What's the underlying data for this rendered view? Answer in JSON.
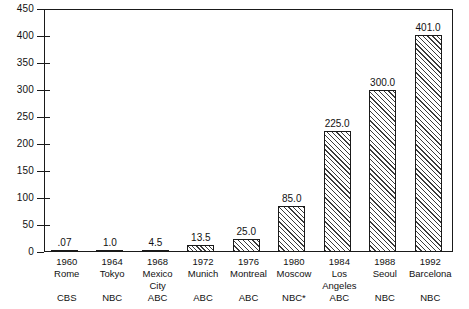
{
  "chart_data": {
    "type": "bar",
    "title": "",
    "subtitle": "",
    "xlabel": "",
    "ylabel": "",
    "ylim": [
      0,
      450
    ],
    "ytick_step": 50,
    "yticks": [
      "450",
      "400",
      "350",
      "300",
      "250",
      "200",
      "150",
      "100",
      "50",
      "0"
    ],
    "grid": false,
    "legend": false,
    "categories": [
      "1960 Rome",
      "1964 Tokyo",
      "1968 Mexico City",
      "1972 Munich",
      "1976 Montreal",
      "1980 Moscow",
      "1984 Los Angeles",
      "1988 Seoul",
      "1992 Barcelona"
    ],
    "values": [
      0.07,
      1.0,
      4.5,
      13.5,
      25.0,
      85.0,
      225.0,
      300.0,
      401.0
    ],
    "data_labels": [
      ".07",
      "1.0",
      "4.5",
      "13.5",
      "25.0",
      "85.0",
      "225.0",
      "300.0",
      "401.0"
    ],
    "bars": [
      {
        "year": "1960",
        "city_line1": "Rome",
        "city_line2": "",
        "network": "CBS",
        "value": 0.07,
        "label": ".07"
      },
      {
        "year": "1964",
        "city_line1": "Tokyo",
        "city_line2": "",
        "network": "NBC",
        "value": 1.0,
        "label": "1.0"
      },
      {
        "year": "1968",
        "city_line1": "Mexico",
        "city_line2": "City",
        "network": "ABC",
        "value": 4.5,
        "label": "4.5"
      },
      {
        "year": "1972",
        "city_line1": "Munich",
        "city_line2": "",
        "network": "ABC",
        "value": 13.5,
        "label": "13.5"
      },
      {
        "year": "1976",
        "city_line1": "Montreal",
        "city_line2": "",
        "network": "ABC",
        "value": 25.0,
        "label": "25.0"
      },
      {
        "year": "1980",
        "city_line1": "Moscow",
        "city_line2": "",
        "network": "NBC*",
        "value": 85.0,
        "label": "85.0"
      },
      {
        "year": "1984",
        "city_line1": "Los",
        "city_line2": "Angeles",
        "network": "ABC",
        "value": 225.0,
        "label": "225.0"
      },
      {
        "year": "1988",
        "city_line1": "Seoul",
        "city_line2": "",
        "network": "NBC",
        "value": 300.0,
        "label": "300.0"
      },
      {
        "year": "1992",
        "city_line1": "Barcelona",
        "city_line2": "",
        "network": "NBC",
        "value": 401.0,
        "label": "401.0"
      }
    ],
    "colors": {
      "axis": "#1a1a1a",
      "bar_outline": "#1a1a1a",
      "bar_hatch": "#3b3b3b",
      "background": "#ffffff",
      "text": "#111111"
    }
  }
}
